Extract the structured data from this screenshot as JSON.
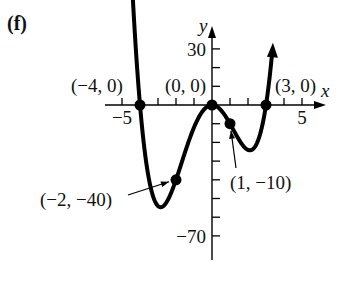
{
  "panel_label": "(f)",
  "chart_data": {
    "type": "line",
    "title": "",
    "function": "f(x) = x^2 (x + 4)(x - 3)",
    "xlabel": "x",
    "ylabel": "y",
    "xlim": [
      -5.5,
      6
    ],
    "ylim": [
      -75,
      40
    ],
    "x_ticks": [
      -5,
      -4,
      -3,
      -2,
      -1,
      1,
      2,
      3,
      4,
      5
    ],
    "x_tick_labels": [
      {
        "value": -5,
        "label": "−5"
      },
      {
        "value": 5,
        "label": "5"
      }
    ],
    "y_ticks": [
      30,
      20,
      10,
      -10,
      -20,
      -30,
      -40,
      -50,
      -60,
      -70
    ],
    "y_tick_labels": [
      {
        "value": 30,
        "label": "30"
      },
      {
        "value": -70,
        "label": "−70"
      }
    ],
    "grid": false,
    "series": [
      {
        "name": "f",
        "x": [
          -4.4,
          -4,
          -3.5,
          -3,
          -2.5,
          -2,
          -1.5,
          -1,
          -0.5,
          0,
          0.5,
          1,
          1.5,
          2,
          2.5,
          3,
          3.3
        ],
        "y": [
          29.4,
          0,
          -28.7,
          -54,
          -53.1,
          -40,
          -23.6,
          -12,
          -3.4,
          0,
          -2.8,
          -10,
          -18.9,
          -24,
          -20.3,
          0,
          26.7
        ]
      }
    ],
    "marked_points": [
      {
        "x": -4,
        "y": 0,
        "label": "(−4, 0)"
      },
      {
        "x": 0,
        "y": 0,
        "label": "(0, 0)"
      },
      {
        "x": 3,
        "y": 0,
        "label": "(3, 0)"
      },
      {
        "x": -2,
        "y": -40,
        "label": "(−2, −40)"
      },
      {
        "x": 1,
        "y": -10,
        "label": "(1, −10)"
      }
    ]
  }
}
